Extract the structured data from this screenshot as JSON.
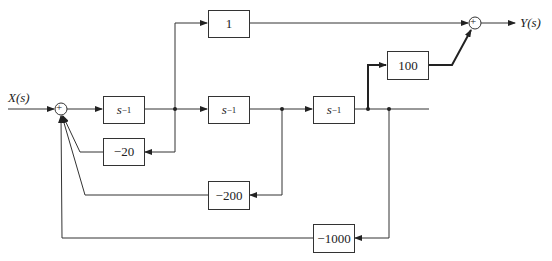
{
  "diagram": {
    "type": "block-diagram",
    "input": {
      "label": "X(s)"
    },
    "output": {
      "label": "Y(s)"
    },
    "summers": [
      {
        "id": "sum-input",
        "sign": "+"
      },
      {
        "id": "sum-output",
        "sign": "+"
      }
    ],
    "blocks": {
      "integrator1": {
        "base": "s",
        "exp": "−1"
      },
      "integrator2": {
        "base": "s",
        "exp": "−1"
      },
      "integrator3": {
        "base": "s",
        "exp": "−1"
      },
      "direct_gain": "1",
      "output_gain": "100",
      "feedback1": "−20",
      "feedback2": "−200",
      "feedback3": "−1000"
    },
    "colors": {
      "line": "#333333",
      "background": "#ffffff"
    }
  }
}
